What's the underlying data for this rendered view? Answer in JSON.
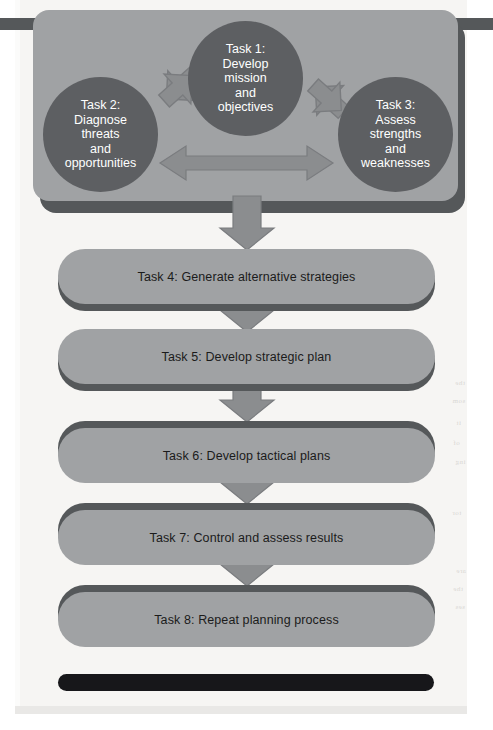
{
  "figure": {
    "type": "flowchart",
    "orientation": "top-to-bottom"
  },
  "top_panel": {
    "name": "planning-foundation-panel",
    "circles": [
      {
        "id": "task-1",
        "label": "Task 1:\nDevelop\nmission\nand\nobjectives",
        "lines": [
          "Task 1:",
          "Develop",
          "mission",
          "and",
          "objectives"
        ],
        "position": "top-center",
        "fill": "#5d5f62",
        "text_color": "#ffffff"
      },
      {
        "id": "task-2",
        "label": "Task 2:\nDiagnose\nthreats\nand\nopportunities",
        "lines": [
          "Task 2:",
          "Diagnose",
          "threats",
          "and",
          "opportunities"
        ],
        "position": "left",
        "fill": "#5d5f62",
        "text_color": "#ffffff"
      },
      {
        "id": "task-3",
        "label": "Task 3:\nAssess\nstrengths\nand\nweaknesses",
        "lines": [
          "Task 3:",
          "Assess",
          "strengths",
          "and",
          "weaknesses"
        ],
        "position": "right",
        "fill": "#5d5f62",
        "text_color": "#ffffff"
      }
    ],
    "connectors": [
      {
        "id": "arrow-task2-task1",
        "type": "double-headed-diagonal",
        "from": "task-2",
        "to": "task-1"
      },
      {
        "id": "arrow-task1-task3",
        "type": "double-headed-diagonal",
        "from": "task-1",
        "to": "task-3"
      },
      {
        "id": "arrow-task2-task3",
        "type": "double-headed-horizontal",
        "from": "task-2",
        "to": "task-3"
      }
    ],
    "fill": "#a0a2a4",
    "shadow": "#55585a"
  },
  "bars": [
    {
      "id": "task-4",
      "label": "Task 4:  Generate alternative strategies",
      "shadow_side": "below"
    },
    {
      "id": "task-5",
      "label": "Task 5:  Develop strategic plan",
      "shadow_side": "below"
    },
    {
      "id": "task-6",
      "label": "Task 6:  Develop tactical plans",
      "shadow_side": "above"
    },
    {
      "id": "task-7",
      "label": "Task 7:  Control and assess results",
      "shadow_side": "above"
    },
    {
      "id": "task-8",
      "label": "Task 8:  Repeat planning process",
      "shadow_side": "above"
    }
  ],
  "flow_arrows": [
    {
      "id": "arrow-panel-to-task4",
      "direction": "down"
    },
    {
      "id": "arrow-task4-to-task5",
      "direction": "down"
    },
    {
      "id": "arrow-task5-to-task6",
      "direction": "down"
    },
    {
      "id": "arrow-task6-to-task7",
      "direction": "down"
    },
    {
      "id": "arrow-task7-to-task8",
      "direction": "down"
    }
  ],
  "rules": {
    "top_rule_color": "#55585a",
    "bottom_rule_color": "#17171a"
  },
  "colors": {
    "page": "#f6f5f3",
    "panel_fill": "#a0a2a4",
    "panel_shadow": "#55585a",
    "circle_fill": "#5d5f62",
    "arrow_fill": "#8b8d8f",
    "arrow_stroke": "#6e7073",
    "bar_text": "#1b1b1b"
  },
  "bleed_text": {
    "lines": [
      "the",
      "som",
      "it",
      "of",
      "ing",
      "tor",
      "are",
      "the",
      "ses"
    ]
  }
}
